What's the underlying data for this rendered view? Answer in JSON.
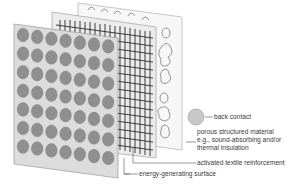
{
  "diagram": {
    "layers": [
      {
        "id": "back-contact",
        "label": "back contact"
      },
      {
        "id": "porous",
        "label_lines": [
          "porous structured material",
          "e.g., sound-absorbing and/or",
          "thermal insulation"
        ]
      },
      {
        "id": "textile",
        "label": "activated textile reinforcement"
      },
      {
        "id": "surface",
        "label": "energy-generating surface"
      }
    ],
    "front_panel": {
      "rows": 7,
      "cols": 7
    },
    "colors": {
      "panel_fill": "#dcdcdc",
      "panel_stroke": "#9a9a9a",
      "cell_fill": "#8f8f8f",
      "grid_line": "#2a2a2a",
      "back_panel_fill": "#f4f4f4",
      "leader_line": "#555555",
      "text": "#3a3a3a"
    }
  }
}
